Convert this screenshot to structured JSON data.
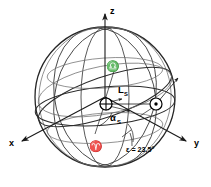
{
  "figure": {
    "background_color": "#ffffff",
    "line_color": "#1a1a1a",
    "faint_line_color": "#6a6a6a"
  },
  "axes": {
    "x": {
      "label": "x",
      "direction": "lower-left",
      "arrow": true
    },
    "y": {
      "label": "y",
      "direction": "lower-right",
      "arrow": true
    },
    "z": {
      "label": "z",
      "direction": "up",
      "arrow": true
    }
  },
  "bodies": {
    "earth": {
      "symbol": "⊕",
      "name": "earth-symbol"
    },
    "sun": {
      "symbol": "⊙",
      "name": "sun-symbol"
    }
  },
  "markers": {
    "aries": {
      "symbol": "♈",
      "name": "aries-vernal-equinox-symbol"
    },
    "libra": {
      "symbol": "♎",
      "name": "libra-autumnal-equinox-symbol"
    }
  },
  "annotations": {
    "ecliptic_longitude": {
      "base": "L",
      "sub": "S"
    },
    "right_ascension": {
      "base": "α",
      "sub": "S"
    },
    "obliquity": {
      "text": "ε = 23,5°"
    }
  }
}
